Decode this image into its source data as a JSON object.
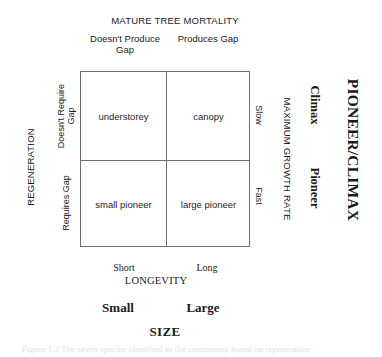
{
  "figure": {
    "top_axis": {
      "title": "MATURE TREE MORTALITY",
      "left_label": "Doesn't Produce\nGap",
      "right_label": "Produces Gap"
    },
    "left_axis": {
      "title": "REGENERATION",
      "top_label": "Doesn't Require\nGap",
      "bottom_label": "Requires Gap"
    },
    "bottom_axis": {
      "title": "LONGEVITY",
      "left_label": "Short",
      "right_label": "Long"
    },
    "bottom_axis_secondary": {
      "title": "SIZE",
      "left_label": "Small",
      "right_label": "Large"
    },
    "right_axis_growth": {
      "title": "MAXIMUM GROWTH RATE",
      "top_label": "Slow",
      "bottom_label": "Fast"
    },
    "right_axis_strategy": {
      "title": "PIONEER/CLIMAX",
      "top_label": "Climax",
      "bottom_label": "Pioneer"
    },
    "matrix": {
      "cells": [
        {
          "id": "top-left",
          "label": "understorey"
        },
        {
          "id": "top-right",
          "label": "canopy"
        },
        {
          "id": "bottom-left",
          "label": "small pioneer"
        },
        {
          "id": "bottom-right",
          "label": "large pioneer"
        }
      ]
    },
    "caption": "Figure 1.2   The seven species identified as the community based on regeneration"
  },
  "colors": {
    "background": "#ffffff",
    "line": "#6e6e6e",
    "text": "#1a1a1a"
  }
}
